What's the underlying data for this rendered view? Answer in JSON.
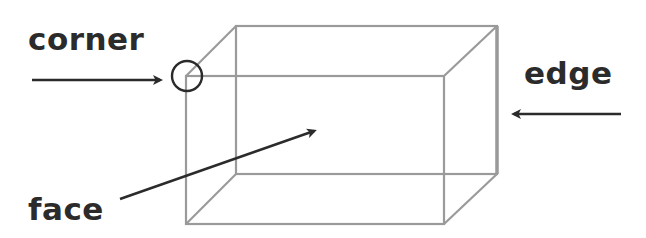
{
  "diagram": {
    "title": "",
    "labels": {
      "corner": "corner",
      "edge": "edge",
      "face": "face"
    },
    "shape": "cuboid",
    "colors": {
      "shape_stroke": "#9a9a9a",
      "arrow": "#2b2b2b",
      "text": "#2b2b2b"
    }
  }
}
